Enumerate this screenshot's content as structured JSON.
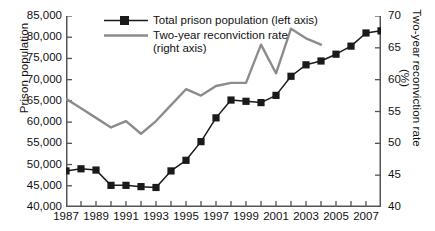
{
  "chart_data": {
    "type": "line",
    "title": "",
    "xlabel": "",
    "x": [
      1987,
      1988,
      1989,
      1990,
      1991,
      1992,
      1993,
      1994,
      1995,
      1996,
      1997,
      1998,
      1999,
      2000,
      2001,
      2002,
      2003,
      2004,
      2005,
      2006,
      2007,
      2008
    ],
    "x_tick_labels": [
      "1987",
      "1989",
      "1991",
      "1993",
      "1995",
      "1997",
      "1999",
      "2001",
      "2003",
      "2005",
      "2007"
    ],
    "x_tick_values": [
      1987,
      1989,
      1991,
      1993,
      1995,
      1997,
      1999,
      2001,
      2003,
      2005,
      2007
    ],
    "xlim": [
      1987,
      2008
    ],
    "grid": false,
    "legend_position": "top-left",
    "axes": [
      {
        "id": "left",
        "label": "Prison population",
        "ylim": [
          40000,
          85000
        ],
        "ticks": [
          40000,
          45000,
          50000,
          55000,
          60000,
          65000,
          70000,
          75000,
          80000,
          85000
        ],
        "tick_labels": [
          "40,000",
          "45,000",
          "50,000",
          "55,000",
          "60,000",
          "65,000",
          "70,000",
          "75,000",
          "80,000",
          "85,000"
        ]
      },
      {
        "id": "right",
        "label": "Two-year reconviction rate (%)",
        "ylim": [
          40,
          70
        ],
        "ticks": [
          40,
          45,
          50,
          55,
          60,
          65,
          70
        ],
        "tick_labels": [
          "40",
          "45",
          "50",
          "55",
          "60",
          "65",
          "70"
        ]
      }
    ],
    "series": [
      {
        "name": "Total prison population (left axis)",
        "legend_label_line1": "Total prison population (left axis)",
        "legend_label_line2": "",
        "axis": "left",
        "color": "#1a1a1a",
        "marker": "square",
        "x": [
          1987,
          1988,
          1989,
          1990,
          1991,
          1992,
          1993,
          1994,
          1995,
          1996,
          1997,
          1998,
          1999,
          2000,
          2001,
          2002,
          2003,
          2004,
          2005,
          2006,
          2007,
          2008
        ],
        "values": [
          48500,
          49000,
          48700,
          45100,
          45100,
          44800,
          44600,
          48500,
          51000,
          55400,
          61000,
          65200,
          64900,
          64600,
          66300,
          70800,
          73500,
          74400,
          76000,
          77900,
          81000,
          81500
        ]
      },
      {
        "name": "Two-year reconviction rate (right axis)",
        "legend_label_line1": "Two-year reconviction rate",
        "legend_label_line2": "(right axis)",
        "axis": "right",
        "color": "#8c8c8c",
        "marker": "none",
        "x": [
          1987,
          1988,
          1989,
          1990,
          1991,
          1992,
          1993,
          1994,
          1995,
          1996,
          1997,
          1998,
          1999,
          2000,
          2001,
          2002,
          2003,
          2004
        ],
        "values": [
          57.0,
          55.5,
          54.0,
          52.5,
          53.5,
          51.5,
          53.5,
          56.0,
          58.5,
          57.5,
          59.0,
          59.5,
          59.5,
          65.5,
          61.0,
          68.0,
          66.5,
          65.5
        ]
      }
    ]
  },
  "colors": {
    "axis": "#555555",
    "series_population": "#1a1a1a",
    "series_reconviction": "#8c8c8c",
    "background": "#ffffff"
  }
}
